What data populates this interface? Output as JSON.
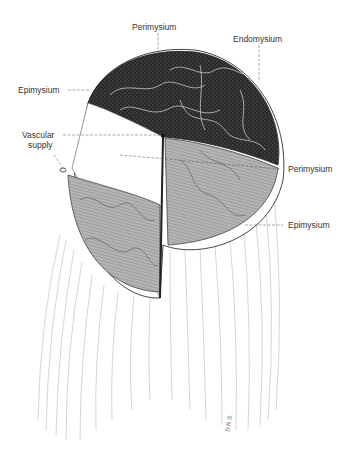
{
  "figure": {
    "labels": {
      "perimysium_top": "Perimysium",
      "endomysium": "Endomysium",
      "epimysium_left": "Epimysium",
      "vascular_line1": "Vascular",
      "vascular_line2": "supply",
      "perimysium_right": "Perimysium",
      "epimysium_right": "Epimysium"
    },
    "signature": "D.R.S.",
    "colors": {
      "dark_fascicles": "#2b2b2b",
      "light_fascicles": "#9a9a9a",
      "line": "#555555",
      "background": "#ffffff"
    }
  }
}
